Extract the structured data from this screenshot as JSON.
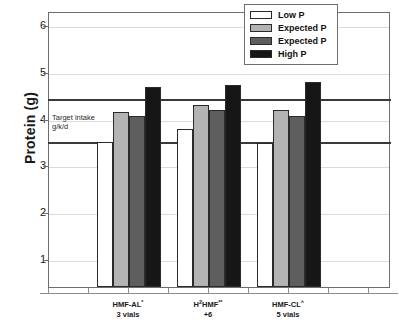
{
  "chart_data": {
    "type": "bar",
    "title": "",
    "xlabel": "",
    "ylabel": "Protein (g)",
    "ylim": [
      0.4,
      6.3
    ],
    "yticks": [
      1,
      2,
      3,
      4,
      5,
      6
    ],
    "ytick_labels": [
      "1",
      "2",
      "3",
      "4",
      "5",
      "6"
    ],
    "grid": true,
    "legend_position": "top-right",
    "categories": [
      "HMF-AL*\n3 vials",
      "H²HMF**\n+6",
      "HMF-CL^\n5 vials"
    ],
    "series": [
      {
        "name": "Low P",
        "color": "#ffffff",
        "values": [
          3.5,
          3.78,
          3.47
        ]
      },
      {
        "name": "Expected P",
        "color": "#b3b3b3",
        "values": [
          4.15,
          4.29,
          4.19
        ]
      },
      {
        "name": "Expected P",
        "color": "#5e5e5e",
        "values": [
          4.05,
          4.19,
          4.06
        ]
      },
      {
        "name": "High P",
        "color": "#161616",
        "values": [
          4.68,
          4.72,
          4.78
        ]
      }
    ],
    "annotations": [
      {
        "name": "target-intake-band",
        "text": "Target intake\ng/k/d",
        "y_low": 3.5,
        "y_high": 4.46
      }
    ]
  },
  "axes": {
    "y_title": "Protein (g)",
    "y_tick_labels": [
      "6",
      "5",
      "4",
      "3",
      "2",
      "1"
    ],
    "x_groups": [
      {
        "line1": "HMF-AL",
        "sup1": "*",
        "line2": "3 vials"
      },
      {
        "line1": "H",
        "sup_pre": "2",
        "line1b": "HMF",
        "sup1": "**",
        "line2": "+6"
      },
      {
        "line1": "HMF-CL",
        "sup1": "^",
        "line2": "5 vials"
      }
    ]
  },
  "legend": {
    "items": [
      {
        "label": "Low P",
        "color": "#ffffff"
      },
      {
        "label": "Expected P",
        "color": "#b3b3b3"
      },
      {
        "label": "Expected P",
        "color": "#5e5e5e"
      },
      {
        "label": "High P",
        "color": "#161616"
      }
    ]
  },
  "target_band": {
    "line1": "Target intake",
    "line2": "g/k/d"
  },
  "colors": {
    "axis": "#6e6e6e",
    "grid": "#dcdcdc",
    "band_stroke": "#3a3a3a",
    "text": "#1a1a1a",
    "background": "#ffffff"
  }
}
